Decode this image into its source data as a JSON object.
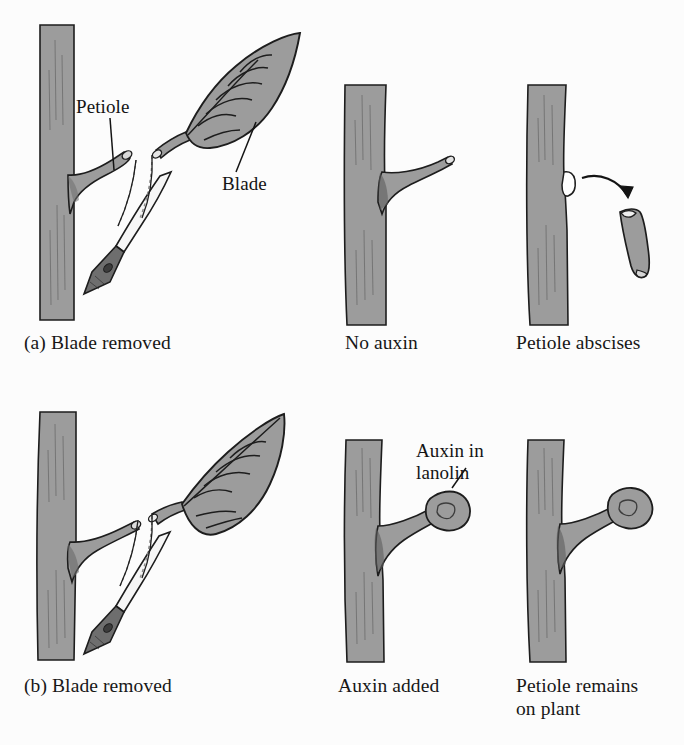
{
  "figure": {
    "background_color": "#fcfcfc",
    "plant_fill": "#9c9c9c",
    "plant_outline": "#1d1d1d",
    "blade_fill": "#f4f4f4",
    "handle_fill": "#6e6e6e",
    "scar_fill": "#ffffff",
    "text_color": "#171717"
  },
  "rows": [
    {
      "id": "row-a",
      "panels": [
        {
          "id": "panel-a1",
          "caption": "(a) Blade removed",
          "labels": [
            {
              "id": "label-petiole",
              "text": "Petiole"
            },
            {
              "id": "label-blade",
              "text": "Blade"
            }
          ]
        },
        {
          "id": "panel-a2",
          "caption": "No auxin",
          "labels": []
        },
        {
          "id": "panel-a3",
          "caption": "Petiole abscises",
          "labels": []
        }
      ]
    },
    {
      "id": "row-b",
      "panels": [
        {
          "id": "panel-b1",
          "caption": "(b) Blade removed",
          "labels": []
        },
        {
          "id": "panel-b2",
          "caption": "Auxin added",
          "labels": [
            {
              "id": "label-auxin-lanolin",
              "text": "Auxin in\nlanolin"
            }
          ]
        },
        {
          "id": "panel-b3",
          "caption": "Petiole remains\non plant",
          "labels": []
        }
      ]
    }
  ]
}
